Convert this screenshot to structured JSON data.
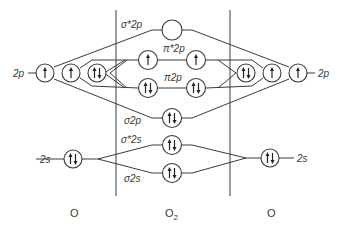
{
  "diagram": {
    "columns": {
      "left": "O",
      "center": "O",
      "center_sub": "2",
      "right": "O"
    },
    "atomic_labels": {
      "left_2p": "2p",
      "right_2p": "2p",
      "left_2s": "2s",
      "right_2s": "2s"
    },
    "mo_labels": {
      "sigma_star_2p": "σ*2p",
      "pi_star_2p": "π*2p",
      "pi_2p": "π2p",
      "sigma_2p": "σ2p",
      "sigma_star_2s": "σ*2s",
      "sigma_2s": "σ2s"
    },
    "orbitals": [
      {
        "id": "left-2p-1",
        "occupancy": "up"
      },
      {
        "id": "left-2p-2",
        "occupancy": "up"
      },
      {
        "id": "left-2p-3",
        "occupancy": "pair"
      },
      {
        "id": "right-2p-1",
        "occupancy": "pair"
      },
      {
        "id": "right-2p-2",
        "occupancy": "up"
      },
      {
        "id": "right-2p-3",
        "occupancy": "up"
      },
      {
        "id": "sigma-star-2p",
        "occupancy": "empty"
      },
      {
        "id": "pi-star-2p-a",
        "occupancy": "up"
      },
      {
        "id": "pi-star-2p-b",
        "occupancy": "up"
      },
      {
        "id": "pi-2p-a",
        "occupancy": "pair"
      },
      {
        "id": "pi-2p-b",
        "occupancy": "pair"
      },
      {
        "id": "sigma-2p",
        "occupancy": "pair"
      },
      {
        "id": "sigma-star-2s",
        "occupancy": "pair"
      },
      {
        "id": "sigma-2s",
        "occupancy": "pair"
      },
      {
        "id": "left-2s",
        "occupancy": "pair"
      },
      {
        "id": "right-2s",
        "occupancy": "pair"
      }
    ]
  }
}
